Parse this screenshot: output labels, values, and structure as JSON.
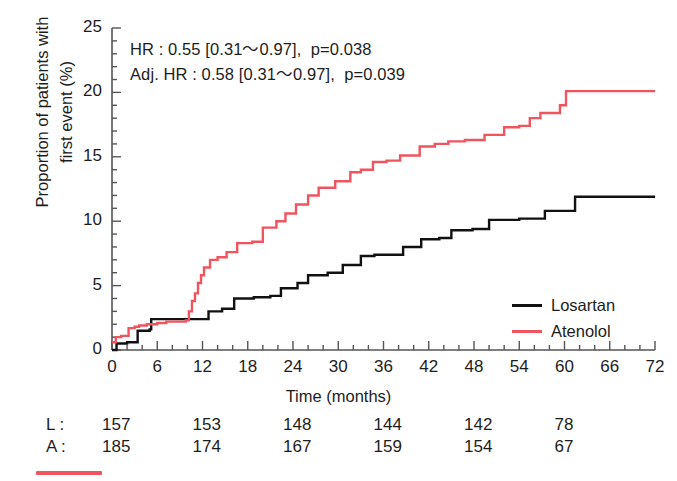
{
  "figure": {
    "width": 677,
    "height": 481
  },
  "annotations": {
    "line1": "HR : 0.55 [0.31～0.97],  p=0.038",
    "line2": "Adj. HR : 0.58 [0.31～0.97],  p=0.039"
  },
  "axes": {
    "ylabel_line1": "Proportion of patients with",
    "ylabel_line2": "first event (%)",
    "xlabel": "Time (months)",
    "yticks": [
      "0",
      "5",
      "10",
      "15",
      "20",
      "25"
    ],
    "xticks": [
      "0",
      "6",
      "12",
      "18",
      "24",
      "30",
      "36",
      "42",
      "48",
      "54",
      "60",
      "66",
      "72"
    ]
  },
  "legend": {
    "items": [
      {
        "label": "Losartan",
        "color": "#111111",
        "key": "losartan"
      },
      {
        "label": "Atenolol",
        "color": "#f0555f",
        "key": "atenolol"
      }
    ]
  },
  "risk_table": {
    "rows": [
      {
        "head": "L : ",
        "values": [
          "157",
          "153",
          "148",
          "144",
          "142",
          "78"
        ]
      },
      {
        "head": "A : ",
        "values": [
          "185",
          "174",
          "167",
          "159",
          "154",
          "67"
        ]
      }
    ],
    "time_points": [
      0,
      12,
      24,
      36,
      48,
      60
    ]
  },
  "colors": {
    "losartan": "#111111",
    "atenolol": "#f0555f",
    "axis": "#555555",
    "text": "#1d1d1d",
    "background": "#ffffff"
  },
  "chart_data": {
    "type": "line",
    "title": "",
    "xlabel": "Time (months)",
    "ylabel": "Proportion of patients with first event (%)",
    "xlim": [
      0,
      72
    ],
    "ylim": [
      0,
      25
    ],
    "grid": false,
    "legend_position": "right-lower",
    "step_style": "post",
    "annotations": [
      "HR : 0.55 [0.31～0.97],  p=0.038",
      "Adj. HR : 0.58 [0.31～0.97],  p=0.039"
    ],
    "series": [
      {
        "name": "Losartan",
        "color": "#111111",
        "x": [
          0,
          0.6,
          2.0,
          3.4,
          5.0,
          5.2,
          11.6,
          12.8,
          14.6,
          16.2,
          18.8,
          21.0,
          22.4,
          24.6,
          26.0,
          28.6,
          30.6,
          33.0,
          34.8,
          38.6,
          41.0,
          43.4,
          45.0,
          47.8,
          50.0,
          54.0,
          57.4,
          61.4,
          72
        ],
        "y": [
          0.0,
          0.5,
          0.6,
          1.5,
          1.6,
          2.4,
          2.4,
          3.0,
          3.2,
          4.0,
          4.1,
          4.2,
          4.8,
          5.2,
          5.8,
          6.0,
          6.6,
          7.3,
          7.4,
          8.0,
          8.6,
          8.7,
          9.3,
          9.4,
          10.1,
          10.2,
          10.8,
          11.9,
          11.9
        ]
      },
      {
        "name": "Atenolol",
        "color": "#f0555f",
        "x": [
          0,
          0.5,
          1.2,
          2.2,
          3.0,
          3.6,
          4.6,
          6.0,
          7.2,
          9.8,
          10.2,
          10.6,
          11.0,
          11.4,
          11.8,
          12.2,
          13.0,
          14.0,
          15.2,
          16.6,
          18.6,
          20.0,
          21.8,
          23.0,
          24.4,
          26.0,
          27.4,
          29.6,
          31.6,
          33.0,
          34.6,
          36.4,
          38.2,
          40.8,
          42.8,
          44.6,
          46.8,
          49.4,
          52.0,
          54.0,
          55.4,
          56.8,
          59.4,
          60.2,
          72
        ],
        "y": [
          0.6,
          1.0,
          1.1,
          1.7,
          1.8,
          1.9,
          2.0,
          2.1,
          2.2,
          2.3,
          3.0,
          3.8,
          4.4,
          5.2,
          5.8,
          6.4,
          7.0,
          7.2,
          7.6,
          8.3,
          8.4,
          9.5,
          10.0,
          10.6,
          11.3,
          12.0,
          12.6,
          13.1,
          13.8,
          14.0,
          14.6,
          14.7,
          15.1,
          15.8,
          16.0,
          16.2,
          16.3,
          16.7,
          17.3,
          17.4,
          18.0,
          18.4,
          19.0,
          20.1,
          20.1
        ]
      }
    ]
  }
}
